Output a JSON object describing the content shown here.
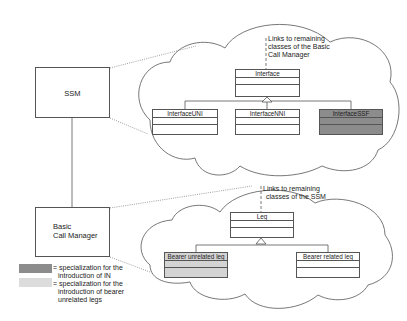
{
  "colors": {
    "in_specialization": "#8c8c8c",
    "bearer_unrelated_specialization": "#d4d4d4",
    "outline": "#555555"
  },
  "components": {
    "ssm": {
      "label": "SSM"
    },
    "basic_call_manager": {
      "label_line1": "Basic",
      "label_line2": "Call Manager"
    }
  },
  "top_cloud": {
    "note_line1": "Links to remaining",
    "note_line2": "classes of the Basic",
    "note_line3": "Call Manager",
    "parent_class": "Interface",
    "subclasses": [
      "InterfaceUNI",
      "InterfaceNNI",
      "InterfaceSSF"
    ]
  },
  "bottom_cloud": {
    "note_line1": "Links to remaining",
    "note_line2": "classes of the SSM",
    "parent_class": "Leg",
    "subclasses": [
      "Bearer unrelated leg",
      "Bearer related leg"
    ]
  },
  "legend": {
    "items": [
      {
        "line1": "= specialization for the",
        "line2": "introduction of IN",
        "line3": ""
      },
      {
        "line1": "= specialization for the",
        "line2": "introduction of bearer",
        "line3": "unrelated legs"
      }
    ]
  }
}
